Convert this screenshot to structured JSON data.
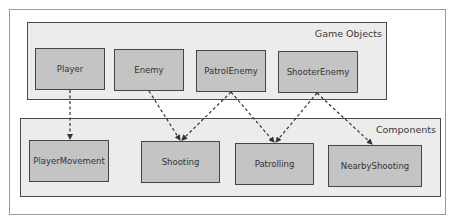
{
  "diagram": {
    "groups": {
      "game_objects": {
        "label": "Game Objects"
      },
      "components": {
        "label": "Components"
      }
    },
    "game_objects": [
      {
        "id": "player",
        "label": "Player"
      },
      {
        "id": "enemy",
        "label": "Enemy"
      },
      {
        "id": "patrol_enemy",
        "label": "PatrolEnemy"
      },
      {
        "id": "shooter_enemy",
        "label": "ShooterEnemy"
      }
    ],
    "components": [
      {
        "id": "player_movement",
        "label": "PlayerMovement"
      },
      {
        "id": "shooting",
        "label": "Shooting"
      },
      {
        "id": "patrolling",
        "label": "Patrolling"
      },
      {
        "id": "nearby_shooting",
        "label": "NearbyShooting"
      }
    ],
    "edges": [
      {
        "from": "Player",
        "to": "PlayerMovement",
        "style": "dashed"
      },
      {
        "from": "Enemy",
        "to": "Shooting",
        "style": "dashed"
      },
      {
        "from": "PatrolEnemy",
        "to": "Shooting",
        "style": "dashed"
      },
      {
        "from": "PatrolEnemy",
        "to": "Patrolling",
        "style": "dashed"
      },
      {
        "from": "ShooterEnemy",
        "to": "Patrolling",
        "style": "dashed"
      },
      {
        "from": "ShooterEnemy",
        "to": "NearbyShooting",
        "style": "dashed"
      }
    ],
    "colors": {
      "node_fill": "#c4c4c4",
      "group_fill": "#ececec",
      "border": "#444444",
      "edge": "#333333"
    }
  }
}
